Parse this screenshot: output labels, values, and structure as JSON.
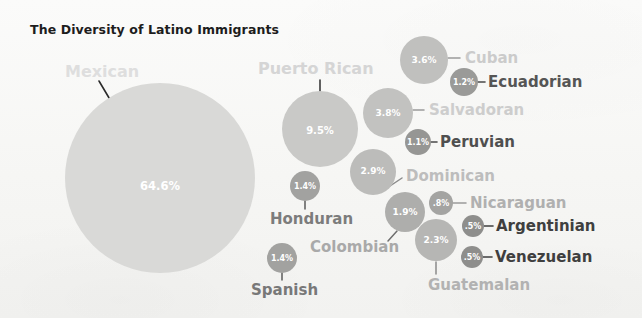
{
  "chart_data": {
    "type": "bubble",
    "title": "The Diversity of Latino Immigrants",
    "xlabel": "",
    "ylabel": "",
    "legend": "none",
    "grid": false,
    "unit": "percent",
    "categories": [
      "Mexican",
      "Puerto Rican",
      "Salvadoran",
      "Cuban",
      "Dominican",
      "Guatemalan",
      "Colombian",
      "Honduran",
      "Spanish",
      "Ecuadorian",
      "Peruvian",
      "Nicaraguan",
      "Argentinian",
      "Venezuelan"
    ],
    "values": [
      64.6,
      9.5,
      3.8,
      3.6,
      2.9,
      2.3,
      1.9,
      1.4,
      1.4,
      1.2,
      1.1,
      0.8,
      0.5,
      0.5
    ],
    "value_labels": [
      "64.6%",
      "9.5%",
      "3.8%",
      "3.6%",
      "2.9%",
      "2.3%",
      "1.9%",
      "1.4%",
      "1.4%",
      "1.2%",
      "1.1%",
      ".8%",
      ".5%",
      ".5%"
    ],
    "bubbles": [
      {
        "name": "Mexican",
        "value": 64.6,
        "label": "64.6%",
        "cx": 160,
        "cy": 178,
        "r": 95,
        "fill": "#d9d9d7",
        "pct_size": 11.5,
        "pct_x": 160,
        "pct_y": 186,
        "label_text": "Mexican",
        "label_x": 65,
        "label_y": 71,
        "label_color": "#dedede",
        "label_size": 16,
        "leader": {
          "x1": 99,
          "y1": 81,
          "x2": 118,
          "y2": 113,
          "color": "#2b2b2b",
          "width": 1.6
        }
      },
      {
        "name": "Puerto Rican",
        "value": 9.5,
        "label": "9.5%",
        "cx": 320,
        "cy": 129,
        "r": 38,
        "fill": "#c9c9c7",
        "pct_size": 10,
        "pct_x": 320,
        "pct_y": 130,
        "label_text": "Puerto Rican",
        "label_x": 258,
        "label_y": 68,
        "label_color": "#d5d5d5",
        "label_size": 16,
        "leader": {
          "x1": 320,
          "y1": 80,
          "x2": 320,
          "y2": 92,
          "color": "#3a3a3a",
          "width": 1.6
        }
      },
      {
        "name": "Salvadoran",
        "value": 3.8,
        "label": "3.8%",
        "cx": 388,
        "cy": 113,
        "r": 25,
        "fill": "#c2c2c0",
        "pct_size": 9,
        "pct_x": 388,
        "pct_y": 113,
        "label_text": "Salvadoran",
        "label_x": 429,
        "label_y": 110,
        "label_color": "#cdcdcd",
        "label_size": 15,
        "leader": {
          "x1": 413,
          "y1": 110,
          "x2": 424,
          "y2": 110,
          "color": "#9a9a9a",
          "width": 1.5
        }
      },
      {
        "name": "Cuban",
        "value": 3.6,
        "label": "3.6%",
        "cx": 424,
        "cy": 60,
        "r": 24,
        "fill": "#c0c0be",
        "pct_size": 9,
        "pct_x": 424,
        "pct_y": 60,
        "label_text": "Cuban",
        "label_x": 465,
        "label_y": 58,
        "label_color": "#cbcbcb",
        "label_size": 15,
        "leader": {
          "x1": 448,
          "y1": 58,
          "x2": 460,
          "y2": 58,
          "color": "#9a9a9a",
          "width": 1.5
        }
      },
      {
        "name": "Dominican",
        "value": 2.9,
        "label": "2.9%",
        "cx": 373,
        "cy": 172,
        "r": 23,
        "fill": "#bcbcba",
        "pct_size": 9,
        "pct_x": 373,
        "pct_y": 171,
        "label_text": "Dominican",
        "label_x": 406,
        "label_y": 176,
        "label_color": "#bdbdbd",
        "label_size": 15,
        "leader": {
          "x1": 390,
          "y1": 186,
          "x2": 402,
          "y2": 178,
          "color": "#8a8a8a",
          "width": 1.5
        }
      },
      {
        "name": "Guatemalan",
        "value": 2.3,
        "label": "2.3%",
        "cx": 436,
        "cy": 240,
        "r": 21,
        "fill": "#b6b6b4",
        "pct_size": 9,
        "pct_x": 436,
        "pct_y": 240,
        "label_text": "Guatemalan",
        "label_x": 428,
        "label_y": 285,
        "label_color": "#b2b2b2",
        "label_size": 15,
        "leader": {
          "x1": 436,
          "y1": 262,
          "x2": 436,
          "y2": 274,
          "color": "#8a8a8a",
          "width": 1.5
        }
      },
      {
        "name": "Colombian",
        "value": 1.9,
        "label": "1.9%",
        "cx": 405,
        "cy": 212,
        "r": 20,
        "fill": "#aeaeac",
        "pct_size": 9,
        "pct_x": 405,
        "pct_y": 212,
        "label_text": "Colombian",
        "label_x": 310,
        "label_y": 247,
        "label_color": "#a9a9a9",
        "label_size": 15,
        "leader": {
          "x1": 397,
          "y1": 231,
          "x2": 388,
          "y2": 241,
          "color": "#6e6e6e",
          "width": 1.5
        }
      },
      {
        "name": "Honduran",
        "value": 1.4,
        "label": "1.4%",
        "cx": 305,
        "cy": 186,
        "r": 15,
        "fill": "#a2a2a0",
        "pct_size": 8,
        "pct_x": 305,
        "pct_y": 186,
        "label_text": "Honduran",
        "label_x": 270,
        "label_y": 219,
        "label_color": "#7c7c7c",
        "label_size": 15,
        "leader": {
          "x1": 305,
          "y1": 201,
          "x2": 305,
          "y2": 209,
          "color": "#5a5a5a",
          "width": 1.5
        }
      },
      {
        "name": "Spanish",
        "value": 1.4,
        "label": "1.4%",
        "cx": 282,
        "cy": 258,
        "r": 15,
        "fill": "#a2a2a0",
        "pct_size": 8,
        "pct_x": 282,
        "pct_y": 258,
        "label_text": "Spanish",
        "label_x": 251,
        "label_y": 290,
        "label_color": "#787878",
        "label_size": 15,
        "leader": {
          "x1": 282,
          "y1": 273,
          "x2": 282,
          "y2": 280,
          "color": "#5a5a5a",
          "width": 1.5
        }
      },
      {
        "name": "Ecuadorian",
        "value": 1.2,
        "label": "1.2%",
        "cx": 464,
        "cy": 82,
        "r": 14,
        "fill": "#9a9a98",
        "pct_size": 8,
        "pct_x": 464,
        "pct_y": 82,
        "label_text": "Ecuadorian",
        "label_x": 488,
        "label_y": 82,
        "label_color": "#555555",
        "label_size": 15,
        "leader": {
          "x1": 477,
          "y1": 82,
          "x2": 485,
          "y2": 82,
          "color": "#4a4a4a",
          "width": 1.6
        }
      },
      {
        "name": "Peruvian",
        "value": 1.1,
        "label": "1.1%",
        "cx": 418,
        "cy": 142,
        "r": 13,
        "fill": "#969694",
        "pct_size": 8,
        "pct_x": 418,
        "pct_y": 142,
        "label_text": "Peruvian",
        "label_x": 440,
        "label_y": 142,
        "label_color": "#4f4f4f",
        "label_size": 15,
        "leader": {
          "x1": 429,
          "y1": 142,
          "x2": 437,
          "y2": 142,
          "color": "#4a4a4a",
          "width": 1.6
        }
      },
      {
        "name": "Nicaraguan",
        "value": 0.8,
        "label": ".8%",
        "cx": 441,
        "cy": 203,
        "r": 12,
        "fill": "#a4a4a2",
        "pct_size": 8,
        "pct_x": 441,
        "pct_y": 203,
        "label_text": "Nicaraguan",
        "label_x": 470,
        "label_y": 203,
        "label_color": "#b0b0b0",
        "label_size": 15,
        "leader": {
          "x1": 452,
          "y1": 203,
          "x2": 466,
          "y2": 203,
          "color": "#9a9a9a",
          "width": 1.5
        }
      },
      {
        "name": "Argentinian",
        "value": 0.5,
        "label": ".5%",
        "cx": 473,
        "cy": 226,
        "r": 11,
        "fill": "#8e8e8c",
        "pct_size": 8,
        "pct_x": 473,
        "pct_y": 226,
        "label_text": "Argentinian",
        "label_x": 496,
        "label_y": 226,
        "label_color": "#3f3f3f",
        "label_size": 15,
        "leader": {
          "x1": 484,
          "y1": 226,
          "x2": 493,
          "y2": 226,
          "color": "#3f3f3f",
          "width": 1.6
        }
      },
      {
        "name": "Venezuelan",
        "value": 0.5,
        "label": ".5%",
        "cx": 472,
        "cy": 257,
        "r": 11,
        "fill": "#8e8e8c",
        "pct_size": 8,
        "pct_x": 472,
        "pct_y": 257,
        "label_text": "Venezuelan",
        "label_x": 495,
        "label_y": 257,
        "label_color": "#3f3f3f",
        "label_size": 15,
        "leader": {
          "x1": 483,
          "y1": 257,
          "x2": 492,
          "y2": 257,
          "color": "#3f3f3f",
          "width": 1.6
        }
      }
    ]
  }
}
